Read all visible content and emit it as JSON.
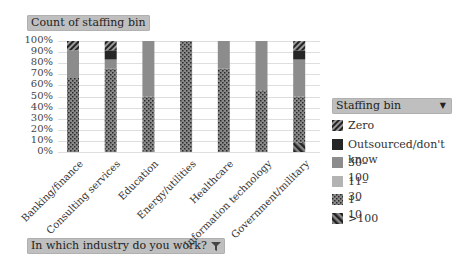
{
  "title_button": {
    "label": "Count of staffing bin"
  },
  "axis_button": {
    "label": "In which industry do you work?",
    "icon": "filter-icon"
  },
  "legend_button": {
    "label": "Staffing bin",
    "icon": "dropdown-arrow-icon"
  },
  "legend": {
    "items": [
      {
        "label": "Zero",
        "pattern": "diagonal-hatch-thin",
        "color": "#333333"
      },
      {
        "label": "Outsourced/don't know",
        "pattern": "solid",
        "color": "#262626"
      },
      {
        "label": "30–100",
        "pattern": "solid",
        "color": "#8c8c8c"
      },
      {
        "label": "11–30",
        "pattern": "solid",
        "color": "#b3b3b3"
      },
      {
        "label": "1–10",
        "pattern": "dots",
        "color": "#7a7a7a"
      },
      {
        "label": ">100",
        "pattern": "diagonal-hatch-thick",
        "color": "#333333"
      }
    ]
  },
  "chart_data": {
    "type": "bar",
    "stacked": "percent",
    "title": "Count of staffing bin",
    "xlabel": "In which industry do you work?",
    "ylabel": "",
    "ylim": [
      0,
      100
    ],
    "y_ticks": [
      "0%",
      "10%",
      "20%",
      "30%",
      "40%",
      "50%",
      "60%",
      "70%",
      "80%",
      "90%",
      "100%"
    ],
    "grid": true,
    "legend_position": "right",
    "legend_title": "Staffing bin",
    "categories": [
      "Banking/finance",
      "Consulting services",
      "Education",
      "Energy/utilities",
      "Healthcare",
      "Information technology",
      "Government/military"
    ],
    "series": [
      {
        "name": ">100",
        "values": [
          0,
          0,
          0,
          0,
          0,
          0,
          8.3
        ]
      },
      {
        "name": "1–10",
        "values": [
          66.7,
          75,
          50,
          100,
          75,
          55.6,
          41.7
        ]
      },
      {
        "name": "11–30",
        "values": [
          0,
          0,
          0,
          0,
          0,
          0,
          0
        ]
      },
      {
        "name": "30–100",
        "values": [
          25,
          8.3,
          50,
          0,
          25,
          44.4,
          33.3
        ]
      },
      {
        "name": "Outsourced/don't know",
        "values": [
          0,
          8.3,
          0,
          0,
          0,
          0,
          8.3
        ]
      },
      {
        "name": "Zero",
        "values": [
          8.3,
          8.3,
          0,
          0,
          0,
          0,
          8.3
        ]
      }
    ]
  }
}
